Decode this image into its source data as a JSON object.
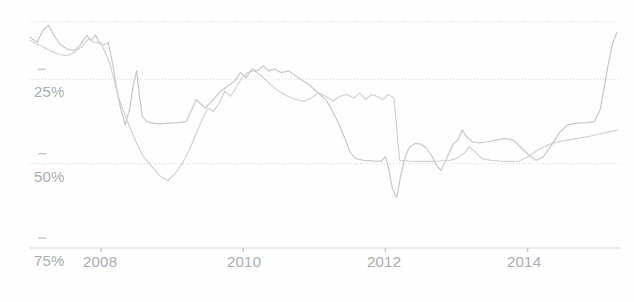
{
  "chart_data": {
    "type": "line",
    "title": "",
    "subtitle": "",
    "xlabel": "",
    "ylabel": "",
    "grid": true,
    "legend": false,
    "y_axis_inverted": true,
    "xlim": [
      2007.0,
      2015.3
    ],
    "ylim": [
      75,
      8
    ],
    "y_ticks": [
      25,
      50,
      75
    ],
    "y_tick_labels": [
      "25%",
      "50%",
      "75%"
    ],
    "x_ticks": [
      2008,
      2010,
      2012,
      2014
    ],
    "x_tick_labels": [
      "2008",
      "2010",
      "2012",
      "2014"
    ],
    "series": [
      {
        "name": "series-1",
        "color": "#c6cacd",
        "points": [
          [
            2007.0,
            12.5
          ],
          [
            2007.1,
            14.0
          ],
          [
            2007.18,
            10.5
          ],
          [
            2007.26,
            9.0
          ],
          [
            2007.34,
            12.0
          ],
          [
            2007.42,
            14.5
          ],
          [
            2007.52,
            16.0
          ],
          [
            2007.62,
            16.5
          ],
          [
            2007.7,
            15.0
          ],
          [
            2007.8,
            12.0
          ],
          [
            2007.86,
            13.5
          ],
          [
            2007.92,
            11.8
          ],
          [
            2007.98,
            14.5
          ],
          [
            2008.04,
            14.8
          ],
          [
            2008.1,
            14.0
          ],
          [
            2008.16,
            20.0
          ],
          [
            2008.22,
            28.0
          ],
          [
            2008.28,
            34.0
          ],
          [
            2008.34,
            38.5
          ],
          [
            2008.4,
            34.0
          ],
          [
            2008.46,
            26.0
          ],
          [
            2008.5,
            22.5
          ],
          [
            2008.54,
            30.0
          ],
          [
            2008.58,
            36.0
          ],
          [
            2008.64,
            37.5
          ],
          [
            2008.72,
            38.0
          ],
          [
            2008.84,
            38.2
          ],
          [
            2008.96,
            38.0
          ],
          [
            2009.08,
            37.8
          ],
          [
            2009.2,
            37.5
          ],
          [
            2009.34,
            31.0
          ],
          [
            2009.46,
            33.5
          ],
          [
            2009.56,
            31.5
          ],
          [
            2009.66,
            29.0
          ],
          [
            2009.78,
            27.0
          ],
          [
            2009.88,
            25.5
          ],
          [
            2009.96,
            23.0
          ],
          [
            2010.04,
            24.5
          ],
          [
            2010.12,
            22.0
          ],
          [
            2010.2,
            22.5
          ],
          [
            2010.28,
            21.0
          ],
          [
            2010.36,
            22.5
          ],
          [
            2010.44,
            22.0
          ],
          [
            2010.54,
            23.0
          ],
          [
            2010.64,
            22.5
          ],
          [
            2010.74,
            24.0
          ],
          [
            2010.84,
            25.5
          ],
          [
            2010.92,
            26.5
          ],
          [
            2011.0,
            28.0
          ],
          [
            2011.08,
            29.5
          ],
          [
            2011.16,
            31.0
          ],
          [
            2011.22,
            33.0
          ],
          [
            2011.28,
            35.5
          ],
          [
            2011.34,
            38.0
          ],
          [
            2011.42,
            42.0
          ],
          [
            2011.5,
            46.5
          ],
          [
            2011.58,
            48.5
          ],
          [
            2011.7,
            49.0
          ],
          [
            2011.82,
            49.2
          ],
          [
            2011.94,
            49.3
          ],
          [
            2012.0,
            48.0
          ],
          [
            2012.04,
            51.0
          ],
          [
            2012.1,
            57.5
          ],
          [
            2012.16,
            60.0
          ],
          [
            2012.22,
            53.0
          ],
          [
            2012.28,
            48.0
          ],
          [
            2012.34,
            45.0
          ],
          [
            2012.42,
            44.0
          ],
          [
            2012.5,
            44.2
          ],
          [
            2012.58,
            45.5
          ],
          [
            2012.66,
            48.0
          ],
          [
            2012.72,
            50.5
          ],
          [
            2012.78,
            52.0
          ],
          [
            2012.84,
            49.5
          ],
          [
            2012.9,
            46.5
          ],
          [
            2012.96,
            44.0
          ],
          [
            2013.02,
            43.0
          ],
          [
            2013.08,
            40.0
          ],
          [
            2013.14,
            42.0
          ],
          [
            2013.22,
            43.5
          ],
          [
            2013.32,
            43.8
          ],
          [
            2013.44,
            43.5
          ],
          [
            2013.56,
            43.0
          ],
          [
            2013.68,
            42.5
          ],
          [
            2013.8,
            43.0
          ],
          [
            2013.92,
            45.5
          ],
          [
            2014.02,
            47.5
          ],
          [
            2014.12,
            49.0
          ],
          [
            2014.22,
            48.0
          ],
          [
            2014.32,
            45.0
          ],
          [
            2014.44,
            41.0
          ],
          [
            2014.56,
            38.5
          ],
          [
            2014.7,
            38.0
          ],
          [
            2014.84,
            37.8
          ],
          [
            2014.94,
            37.5
          ],
          [
            2015.02,
            34.0
          ],
          [
            2015.08,
            27.0
          ],
          [
            2015.14,
            20.0
          ],
          [
            2015.2,
            14.0
          ],
          [
            2015.26,
            11.0
          ]
        ]
      },
      {
        "name": "series-2",
        "color": "#cdd1d4",
        "points": [
          [
            2007.0,
            13.5
          ],
          [
            2007.14,
            15.0
          ],
          [
            2007.28,
            16.5
          ],
          [
            2007.4,
            17.5
          ],
          [
            2007.52,
            18.0
          ],
          [
            2007.62,
            17.0
          ],
          [
            2007.72,
            15.5
          ],
          [
            2007.82,
            13.0
          ],
          [
            2007.9,
            14.0
          ],
          [
            2008.0,
            14.2
          ],
          [
            2008.12,
            20.0
          ],
          [
            2008.24,
            30.0
          ],
          [
            2008.36,
            37.0
          ],
          [
            2008.48,
            43.0
          ],
          [
            2008.58,
            47.5
          ],
          [
            2008.7,
            50.5
          ],
          [
            2008.82,
            53.5
          ],
          [
            2008.94,
            55.0
          ],
          [
            2009.04,
            53.0
          ],
          [
            2009.14,
            50.0
          ],
          [
            2009.24,
            46.0
          ],
          [
            2009.34,
            41.0
          ],
          [
            2009.42,
            37.0
          ],
          [
            2009.5,
            33.5
          ],
          [
            2009.58,
            34.5
          ],
          [
            2009.66,
            32.0
          ],
          [
            2009.74,
            28.5
          ],
          [
            2009.82,
            30.0
          ],
          [
            2009.9,
            27.5
          ],
          [
            2009.98,
            24.5
          ],
          [
            2010.06,
            23.0
          ],
          [
            2010.16,
            22.5
          ],
          [
            2010.26,
            24.0
          ],
          [
            2010.38,
            26.5
          ],
          [
            2010.5,
            28.5
          ],
          [
            2010.62,
            30.0
          ],
          [
            2010.74,
            31.0
          ],
          [
            2010.86,
            31.5
          ],
          [
            2010.96,
            30.5
          ],
          [
            2011.06,
            29.0
          ],
          [
            2011.16,
            30.0
          ],
          [
            2011.26,
            31.5
          ],
          [
            2011.36,
            30.0
          ],
          [
            2011.46,
            29.5
          ],
          [
            2011.56,
            30.5
          ],
          [
            2011.64,
            29.0
          ],
          [
            2011.72,
            31.0
          ],
          [
            2011.8,
            29.5
          ],
          [
            2011.88,
            30.0
          ],
          [
            2011.96,
            31.0
          ],
          [
            2012.04,
            29.5
          ],
          [
            2012.12,
            30.5
          ],
          [
            2012.2,
            49.0
          ],
          [
            2012.34,
            49.2
          ],
          [
            2012.48,
            49.3
          ],
          [
            2012.62,
            49.3
          ],
          [
            2012.76,
            49.2
          ],
          [
            2012.9,
            49.0
          ],
          [
            2013.0,
            48.5
          ],
          [
            2013.1,
            47.0
          ],
          [
            2013.18,
            45.0
          ],
          [
            2013.26,
            46.5
          ],
          [
            2013.36,
            48.5
          ],
          [
            2013.48,
            49.0
          ],
          [
            2013.6,
            49.2
          ],
          [
            2013.74,
            49.3
          ],
          [
            2013.88,
            49.2
          ],
          [
            2014.0,
            48.0
          ],
          [
            2014.14,
            46.0
          ],
          [
            2014.28,
            44.5
          ],
          [
            2014.42,
            43.5
          ],
          [
            2014.56,
            43.0
          ],
          [
            2014.7,
            42.5
          ],
          [
            2014.84,
            42.0
          ],
          [
            2014.96,
            41.5
          ],
          [
            2015.06,
            41.0
          ],
          [
            2015.16,
            40.5
          ],
          [
            2015.26,
            40.0
          ]
        ]
      }
    ]
  },
  "axes": {
    "y_tick_labels": [
      "25%",
      "50%",
      "75%"
    ],
    "x_tick_labels": [
      "2008",
      "2010",
      "2012",
      "2014"
    ]
  }
}
